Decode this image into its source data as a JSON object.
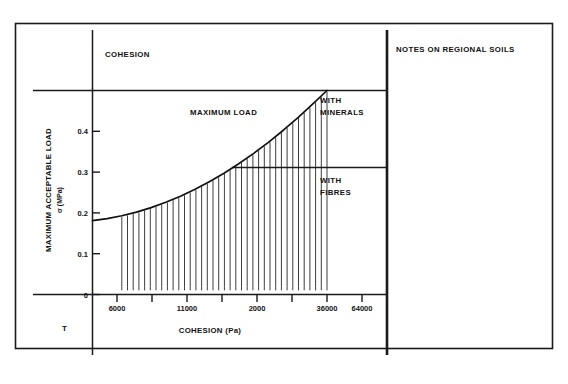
{
  "figure": {
    "right_panel_heading": "NOTES ON REGIONAL SOILS",
    "top_left_heading": "COHESION",
    "corner_mark": "T",
    "band_labels": {
      "upper": "WITH\nMINERALS",
      "upper_line1": "WITH",
      "upper_line2": "MINERALS",
      "lower_line1": "WITH",
      "lower_line2": "FIBRES"
    }
  },
  "chart_data": {
    "type": "line",
    "title": "",
    "annotation": "MAXIMUM LOAD",
    "xlabel": "COHESION (Pa)",
    "ylabel": "MAXIMUM  ACCEPTABLE  LOAD",
    "ylabel_units": "σ (MPa)",
    "xtick_labels": [
      "6000",
      "11000",
      "2000",
      "36000",
      "64000"
    ],
    "ytick_labels": [
      "0",
      "0.1",
      "0.2",
      "0.3",
      "0.4"
    ],
    "ytick_values": [
      0,
      0.1,
      0.2,
      0.3,
      0.4
    ],
    "ylim": [
      0,
      0.5
    ],
    "xlim": [
      0,
      5.6
    ],
    "grid": false,
    "legend": null,
    "series": [
      {
        "name": "MAXIMUM LOAD",
        "x": [
          0.0,
          0.25,
          0.5,
          0.75,
          1.0,
          1.25,
          1.5,
          1.75,
          2.0,
          2.25,
          2.5,
          2.75,
          3.0,
          3.25,
          3.5,
          3.75,
          4.0
        ],
        "y": [
          0.181,
          0.186,
          0.193,
          0.202,
          0.213,
          0.226,
          0.241,
          0.258,
          0.277,
          0.298,
          0.321,
          0.346,
          0.373,
          0.402,
          0.433,
          0.466,
          0.5
        ]
      }
    ],
    "hatched_region": {
      "x_start": 0.5,
      "x_end": 4.0,
      "baseline": 0.02,
      "line_count": 37
    },
    "reference_lines": [
      {
        "label": "WITH MINERALS",
        "y": 0.5
      },
      {
        "label": "WITH FIBRES",
        "y": 0.3
      }
    ]
  }
}
